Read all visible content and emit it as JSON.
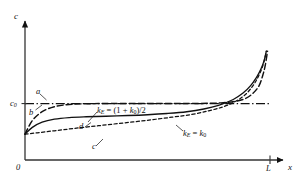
{
  "figure": {
    "background_color": "#ffffff",
    "ink_color": "#111111"
  },
  "axes": {
    "y_axis_label": "c",
    "x_axis_label": "x",
    "origin_label": "0",
    "x_end_tick_label": "L",
    "y_reference_tick_label": "c",
    "y_reference_tick_subscript": "0"
  },
  "curve_labels": {
    "a": "a",
    "b": "b",
    "c": "c",
    "d": "d"
  },
  "annotations": {
    "upper_formula": {
      "symbol": "k",
      "symbol_subscript": "E",
      "equals": " = (1 + ",
      "k_zero": "k",
      "k_zero_subscript": "0",
      "tail": ")/2",
      "full_text": "kE = (1 + k0)/2"
    },
    "lower_formula": {
      "symbol": "k",
      "symbol_subscript": "E",
      "equals": " = ",
      "k_zero": "k",
      "k_zero_subscript": "0",
      "full_text": "kE = k0"
    }
  },
  "chart_data": {
    "type": "line",
    "title": "",
    "xlabel": "x",
    "ylabel": "c",
    "xlim": [
      0,
      1
    ],
    "ylim": [
      0,
      1
    ],
    "grid": false,
    "legend": "inline-curve-letters",
    "xtick_labels": [
      "0",
      "L"
    ],
    "xtick_values": [
      0,
      1
    ],
    "ytick_labels": [
      "c0"
    ],
    "ytick_values": [
      0.415
    ],
    "reference_level_c0": 0.415,
    "start_concentration": 0.19,
    "series": [
      {
        "name": "a",
        "label": "a",
        "linestyle": "dashdot",
        "description": "horizontal reference line at c0 (complete mixing, kE = 1)",
        "x": [
          0.0,
          1.0
        ],
        "y": [
          0.415,
          0.415
        ]
      },
      {
        "name": "b",
        "label": "b",
        "linestyle": "longdash",
        "description": "rises steeply from start, plateaus at c0, then climbs sharply near x = L",
        "x": [
          0.0,
          0.03,
          0.07,
          0.12,
          0.18,
          0.26,
          0.35,
          0.5,
          0.62,
          0.72,
          0.8,
          0.86,
          0.9,
          0.93,
          0.955,
          0.97,
          0.98,
          0.99
        ],
        "y": [
          0.19,
          0.29,
          0.355,
          0.392,
          0.408,
          0.414,
          0.415,
          0.415,
          0.415,
          0.416,
          0.42,
          0.432,
          0.452,
          0.49,
          0.545,
          0.62,
          0.69,
          0.8
        ]
      },
      {
        "name": "c",
        "label": "c",
        "linestyle": "shortdash",
        "description": "lowest curve, slow monotonic rise, kE = k0, steep rise near x = L",
        "x": [
          0.0,
          0.05,
          0.12,
          0.2,
          0.3,
          0.4,
          0.5,
          0.6,
          0.68,
          0.75,
          0.81,
          0.86,
          0.9,
          0.93,
          0.95,
          0.965,
          0.975,
          0.985
        ],
        "y": [
          0.19,
          0.2,
          0.215,
          0.232,
          0.252,
          0.272,
          0.292,
          0.315,
          0.335,
          0.362,
          0.392,
          0.432,
          0.482,
          0.545,
          0.605,
          0.665,
          0.72,
          0.8
        ]
      },
      {
        "name": "d",
        "label": "d",
        "linestyle": "solid",
        "description": "intermediate curve, kE = (1 + k0)/2, rises then flattens, steep near x = L",
        "x": [
          0.0,
          0.03,
          0.07,
          0.12,
          0.18,
          0.25,
          0.33,
          0.42,
          0.5,
          0.58,
          0.66,
          0.73,
          0.79,
          0.85,
          0.89,
          0.92,
          0.945,
          0.962,
          0.975,
          0.985
        ],
        "y": [
          0.19,
          0.24,
          0.278,
          0.3,
          0.312,
          0.318,
          0.322,
          0.327,
          0.333,
          0.342,
          0.355,
          0.375,
          0.402,
          0.445,
          0.492,
          0.545,
          0.608,
          0.665,
          0.725,
          0.8
        ]
      }
    ]
  }
}
